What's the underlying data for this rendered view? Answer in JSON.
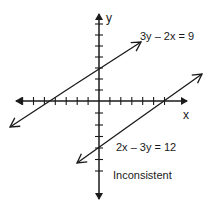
{
  "diagram": {
    "axes": {
      "x_label": "x",
      "y_label": "y",
      "x_ticks": [
        -8,
        -7,
        -6,
        -5,
        -4,
        -3,
        -2,
        -1,
        1,
        2,
        3,
        4,
        5,
        6,
        7,
        8
      ],
      "y_ticks": [
        -8,
        -7,
        -6,
        -5,
        -4,
        -3,
        -2,
        -1,
        1,
        2,
        3,
        4,
        5,
        6,
        7
      ]
    },
    "lines": [
      {
        "equation": "3y – 2x = 9",
        "slope": "2/3",
        "y_intercept": 3,
        "x_intercept": -4.5
      },
      {
        "equation": "2x – 3y = 12",
        "slope": "2/3",
        "y_intercept": -4,
        "x_intercept": 6
      }
    ],
    "caption": "Inconsistent",
    "colors": {
      "ink": "#1a1a1a",
      "background": "#ffffff"
    }
  }
}
